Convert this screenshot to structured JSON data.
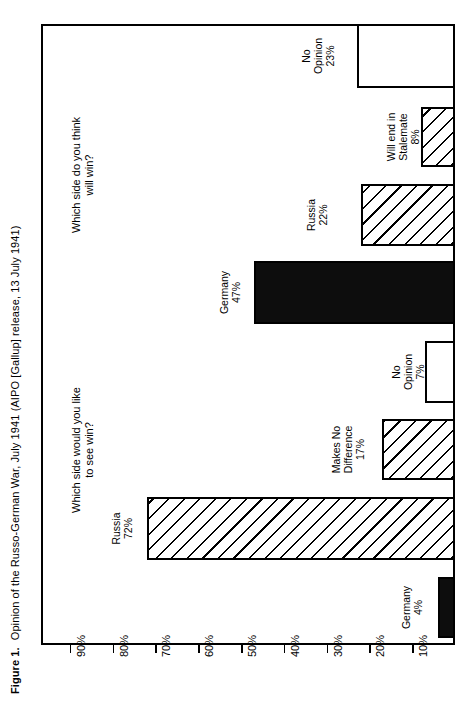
{
  "figure": {
    "label": "Figure 1.",
    "caption": "Opinion of the Russo-German War, July 1941 (AIPO [Gallup] release, 13 July 1941)"
  },
  "chart_data": {
    "type": "bar",
    "orientation": "horizontal-rotated",
    "title": "Opinion of the Russo-German War, July 1941 (AIPO [Gallup] release, 13 July 1941)",
    "xlabel": "",
    "ylabel": "",
    "axis_ticks": [
      "90%",
      "80%",
      "70%",
      "60%",
      "50%",
      "40%",
      "30%",
      "20%",
      "10%"
    ],
    "axis_tick_values": [
      90,
      80,
      70,
      60,
      50,
      40,
      30,
      20,
      10
    ],
    "axis_range": [
      0,
      95
    ],
    "grid": false,
    "legend": "none",
    "groups": [
      {
        "question": "Which side would you like\nto see win?",
        "bars": [
          {
            "label": "Russia",
            "value": 72,
            "value_label": "72%",
            "fill": "hatch"
          },
          {
            "label": "Makes No\nDifference",
            "value": 17,
            "value_label": "17%",
            "fill": "hatch"
          },
          {
            "label": "No\nOpinion",
            "value": 7,
            "value_label": "7%",
            "fill": "open"
          },
          {
            "label": "Germany",
            "value": 4,
            "value_label": "4%",
            "fill": "solid"
          }
        ]
      },
      {
        "question": "Which side do you think\nwill win?",
        "bars": [
          {
            "label": "No\nOpinion",
            "value": 23,
            "value_label": "23%",
            "fill": "open"
          },
          {
            "label": "Will end in\nStalemate",
            "value": 8,
            "value_label": "8%",
            "fill": "hatch"
          },
          {
            "label": "Russia",
            "value": 22,
            "value_label": "22%",
            "fill": "hatch"
          },
          {
            "label": "Germany",
            "value": 47,
            "value_label": "47%",
            "fill": "solid"
          }
        ]
      }
    ],
    "categories": [
      "Russia",
      "Makes No Difference",
      "No Opinion",
      "Germany",
      "No Opinion",
      "Will end in Stalemate",
      "Russia",
      "Germany"
    ],
    "values": [
      72,
      17,
      7,
      4,
      23,
      8,
      22,
      47
    ],
    "colors": {
      "solid": "#0d0d0d",
      "outline": "#000000",
      "background": "#ffffff"
    }
  },
  "bars_render": [
    {
      "name": "bar-no-opinion-23",
      "label": "No\nOpinion",
      "value_label": "23%",
      "value": 23,
      "fill": "open",
      "top": 24,
      "thickness": 64,
      "label_y": 22,
      "label_x": 300
    },
    {
      "name": "bar-will-end-in-stalemate-8",
      "label": "Will end in\nStalemate",
      "value_label": "8%",
      "value": 8,
      "fill": "hatch",
      "top": 107,
      "thickness": 60,
      "label_y": 105,
      "label_x": 385
    },
    {
      "name": "bar-russia-22",
      "label": "Russia",
      "value_label": "22%",
      "value": 22,
      "fill": "hatch",
      "top": 184,
      "thickness": 62,
      "label_y": 182,
      "label_x": 305
    },
    {
      "name": "bar-germany-47",
      "label": "Germany",
      "value_label": "47%",
      "value": 47,
      "fill": "solid",
      "top": 261,
      "thickness": 63,
      "label_y": 259,
      "label_x": 218
    },
    {
      "name": "bar-no-opinion-7",
      "label": "No\nOpinion",
      "value_label": "7%",
      "value": 7,
      "fill": "open",
      "top": 341,
      "thickness": 62,
      "label_y": 339,
      "label_x": 390
    },
    {
      "name": "bar-makes-no-difference-17",
      "label": "Makes No\nDifference",
      "value_label": "17%",
      "value": 17,
      "fill": "hatch",
      "top": 419,
      "thickness": 61,
      "label_y": 417,
      "label_x": 330
    },
    {
      "name": "bar-russia-72",
      "label": "Russia",
      "value_label": "72%",
      "value": 72,
      "fill": "hatch",
      "top": 497,
      "thickness": 63,
      "label_y": 495,
      "label_x": 110
    },
    {
      "name": "bar-germany-4",
      "label": "Germany",
      "value_label": "4%",
      "value": 4,
      "fill": "solid",
      "top": 577,
      "thickness": 61,
      "label_y": 575,
      "label_x": 400
    }
  ],
  "questions_render": [
    {
      "name": "question-will-win",
      "text": "Which side do you think\nwill win?",
      "x": 70,
      "y": 75
    },
    {
      "name": "question-like-to-see-win",
      "text": "Which side would you like\nto see win?",
      "x": 70,
      "y": 350
    }
  ]
}
